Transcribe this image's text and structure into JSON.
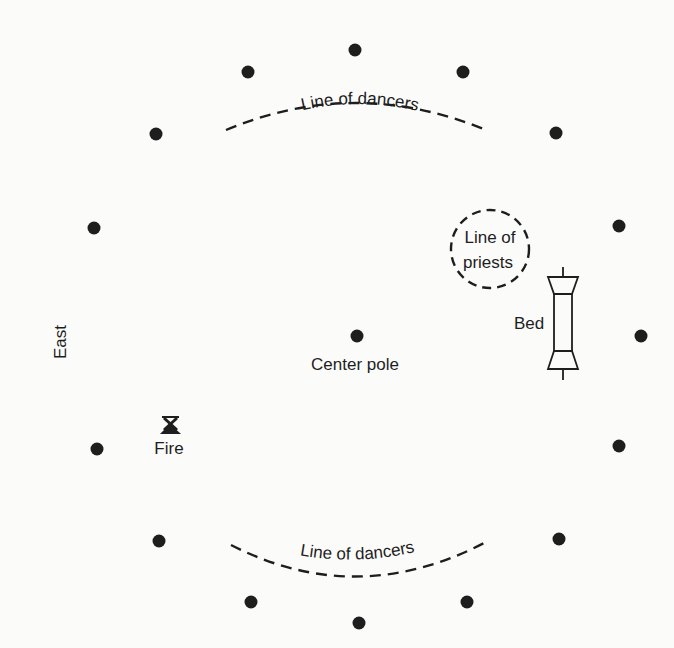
{
  "diagram": {
    "labels": {
      "top_dancers": "Line of dancers",
      "bottom_dancers": "Line of dancers",
      "priests_line1": "Line of",
      "priests_line2": "priests",
      "bed": "Bed",
      "center_pole": "Center pole",
      "fire": "Fire",
      "east": "East"
    },
    "posts": [
      {
        "x": 355,
        "y": 50
      },
      {
        "x": 248,
        "y": 72
      },
      {
        "x": 463,
        "y": 72
      },
      {
        "x": 156,
        "y": 134
      },
      {
        "x": 556,
        "y": 133
      },
      {
        "x": 94,
        "y": 228
      },
      {
        "x": 619,
        "y": 226
      },
      {
        "x": 641,
        "y": 336
      },
      {
        "x": 97,
        "y": 449
      },
      {
        "x": 619,
        "y": 446
      },
      {
        "x": 159,
        "y": 541
      },
      {
        "x": 559,
        "y": 539
      },
      {
        "x": 251,
        "y": 602
      },
      {
        "x": 467,
        "y": 602
      },
      {
        "x": 359,
        "y": 623
      }
    ],
    "center_pole": {
      "x": 357,
      "y": 336
    },
    "ink_color": "#1e1e1e",
    "paper_color": "#fbfbfa"
  }
}
